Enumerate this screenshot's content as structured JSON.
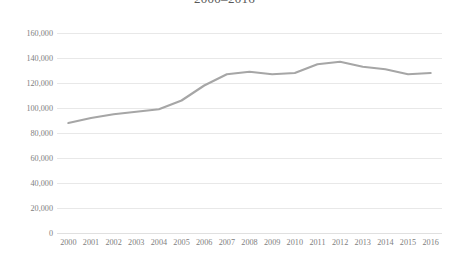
{
  "chart_data": {
    "type": "line",
    "title": "2000–2016",
    "xlabel": "",
    "ylabel": "",
    "categories": [
      "2000",
      "2001",
      "2002",
      "2003",
      "2004",
      "2005",
      "2006",
      "2007",
      "2008",
      "2009",
      "2010",
      "2011",
      "2012",
      "2013",
      "2014",
      "2015",
      "2016"
    ],
    "series": [
      {
        "name": "Series 1",
        "color": "#a6a6a6",
        "values": [
          88000,
          92000,
          95000,
          97000,
          99000,
          106000,
          118000,
          127000,
          129000,
          127000,
          128000,
          135000,
          137000,
          133000,
          131000,
          127000,
          128000
        ]
      }
    ],
    "ylim": [
      0,
      160000
    ],
    "y_ticks": [
      0,
      20000,
      40000,
      60000,
      80000,
      100000,
      120000,
      140000,
      160000
    ],
    "y_tick_labels": [
      "0",
      "20,000",
      "40,000",
      "60,000",
      "80,000",
      "100,000",
      "120,000",
      "140,000",
      "160,000"
    ],
    "grid": true,
    "grid_color": "#e8e8e8",
    "legend": false,
    "legend_position": "none",
    "markers": false
  }
}
